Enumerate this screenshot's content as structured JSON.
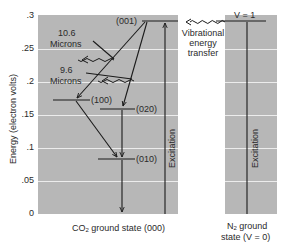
{
  "diagram": {
    "y_axis": {
      "label": "Energy (electron volts)",
      "ticks": [
        ".3",
        ".25",
        ".2",
        ".15",
        ".1",
        ".05",
        "0"
      ]
    },
    "co2_panel": {
      "caption_pre": "CO",
      "caption_sub": "2",
      "caption_post": " ground state (000)",
      "levels": [
        {
          "label": "(001)",
          "energy": 0.29
        },
        {
          "label": "(100)",
          "energy": 0.172
        },
        {
          "label": "(020)",
          "energy": 0.159
        },
        {
          "label": "(010)",
          "energy": 0.083
        }
      ],
      "excitation_label": "Excitation",
      "emissions": [
        {
          "line1": "10.6",
          "line2": "Microns"
        },
        {
          "line1": "9.6",
          "line2": "Microns"
        }
      ]
    },
    "n2_panel": {
      "caption_line1_pre": "N",
      "caption_line1_sub": "2",
      "caption_line1_post": " ground",
      "caption_line2": "state (V = 0)",
      "level_label": "V = 1",
      "excitation_label": "Excitation"
    },
    "transfer": {
      "line1": "Vibrational",
      "line2": "energy",
      "line3": "transfer"
    },
    "colors": {
      "panel": "#b7b7b7",
      "gridline": "#ececec",
      "ink": "#1a1a1a"
    }
  }
}
